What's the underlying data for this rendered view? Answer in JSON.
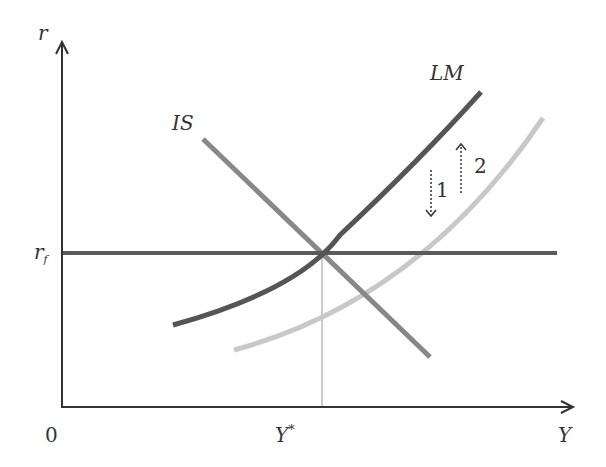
{
  "diagram": {
    "type": "IS-LM",
    "axes": {
      "y_label": "r",
      "x_label": "Y",
      "origin_label": "0"
    },
    "levels": {
      "world_rate_label": "r",
      "world_rate_subscript": "f",
      "equilibrium_output_label": "Y",
      "equilibrium_output_superscript": "*"
    },
    "curves": {
      "is_label": "IS",
      "lm_label": "LM"
    },
    "shifts": {
      "arrow_1_label": "1",
      "arrow_2_label": "2"
    },
    "colors": {
      "axis": "#333333",
      "lm_curve": "#555555",
      "lm_shifted_curve": "#c8c8c8",
      "is_curve": "#888888",
      "rf_line": "#5a5a5a",
      "guide_line": "#888888"
    }
  }
}
